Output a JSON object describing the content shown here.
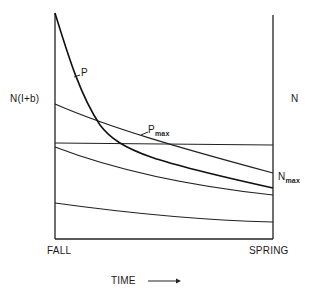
{
  "figure": {
    "y_left_label": "N(I+b)",
    "y_right_label": "N",
    "x_start_label": "FALL",
    "x_end_label": "SPRING",
    "x_axis_label": "TIME",
    "x_axis_arrow": "arrow-right",
    "curves": [
      {
        "name": "P",
        "label": "P",
        "style": "bold decreasing curve"
      },
      {
        "name": "Pmax",
        "label": "P",
        "label_sub": "max",
        "style": "horizontal line"
      },
      {
        "name": "Nmax",
        "label": "N",
        "label_sub": "max",
        "style": "decreasing line"
      },
      {
        "name": "lower-1",
        "label": "",
        "style": "decreasing line"
      },
      {
        "name": "lower-2",
        "label": "",
        "style": "decreasing line"
      }
    ]
  }
}
